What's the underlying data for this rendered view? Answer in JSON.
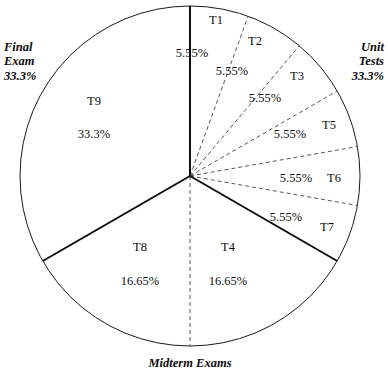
{
  "chart_data": {
    "type": "pie",
    "title": "",
    "subtitle": "",
    "xlabel": "",
    "ylabel": "",
    "legend_position": "outside-radial",
    "grid": false,
    "total_percent": 100,
    "center": {
      "x": 190,
      "y": 176
    },
    "radius": 170,
    "start_angle_deg": 0,
    "direction": "clockwise",
    "categories": [
      "T1",
      "T2",
      "T3",
      "T5",
      "T6",
      "T7",
      "T4",
      "T8",
      "T9"
    ],
    "values": [
      5.55,
      5.55,
      5.55,
      5.55,
      5.55,
      5.55,
      16.65,
      16.65,
      33.3
    ],
    "slices": [
      {
        "name": "T1",
        "percent_label": "5.55%",
        "value": 5.55,
        "group": "Unit Tests",
        "start_deg": 0,
        "end_deg": 20,
        "name_pos": {
          "x": 216,
          "y": 14
        },
        "pct_pos": {
          "x": 192,
          "y": 47
        }
      },
      {
        "name": "T2",
        "percent_label": "5.55%",
        "value": 5.55,
        "group": "Unit Tests",
        "start_deg": 20,
        "end_deg": 40,
        "name_pos": {
          "x": 255,
          "y": 35
        },
        "pct_pos": {
          "x": 232,
          "y": 65
        }
      },
      {
        "name": "T3",
        "percent_label": "5.55%",
        "value": 5.55,
        "group": "Unit Tests",
        "start_deg": 40,
        "end_deg": 60,
        "name_pos": {
          "x": 297,
          "y": 70
        },
        "pct_pos": {
          "x": 265,
          "y": 92
        }
      },
      {
        "name": "T5",
        "percent_label": "5.55%",
        "value": 5.55,
        "group": "Unit Tests",
        "start_deg": 60,
        "end_deg": 80,
        "name_pos": {
          "x": 329,
          "y": 119
        },
        "pct_pos": {
          "x": 290,
          "y": 128
        }
      },
      {
        "name": "T6",
        "percent_label": "5.55%",
        "value": 5.55,
        "group": "Unit Tests",
        "start_deg": 80,
        "end_deg": 100,
        "name_pos": {
          "x": 334,
          "y": 172
        },
        "pct_pos": {
          "x": 296,
          "y": 172
        }
      },
      {
        "name": "T7",
        "percent_label": "5.55%",
        "value": 5.55,
        "group": "Unit Tests",
        "start_deg": 100,
        "end_deg": 120,
        "name_pos": {
          "x": 327,
          "y": 221
        },
        "pct_pos": {
          "x": 286,
          "y": 211
        }
      },
      {
        "name": "T4",
        "percent_label": "16.65%",
        "value": 16.65,
        "group": "Midterm Exams",
        "start_deg": 120,
        "end_deg": 180,
        "name_pos": {
          "x": 228,
          "y": 241
        },
        "pct_pos": {
          "x": 228,
          "y": 275
        }
      },
      {
        "name": "T8",
        "percent_label": "16.65%",
        "value": 16.65,
        "group": "Midterm Exams",
        "start_deg": 180,
        "end_deg": 240,
        "name_pos": {
          "x": 140,
          "y": 241
        },
        "pct_pos": {
          "x": 140,
          "y": 275
        }
      },
      {
        "name": "T9",
        "percent_label": "33.3%",
        "value": 33.3,
        "group": "Final Exam",
        "start_deg": 240,
        "end_deg": 360,
        "name_pos": {
          "x": 94,
          "y": 95
        },
        "pct_pos": {
          "x": 94,
          "y": 128
        }
      }
    ],
    "groups": [
      {
        "key": "final_exam",
        "label_lines": [
          "Final",
          "Exam",
          "33.3%"
        ],
        "percent": 33.3,
        "start_deg": 240,
        "end_deg": 360,
        "members": [
          "T9"
        ],
        "label_pos": {
          "x": 4,
          "y": 40
        },
        "align": "left"
      },
      {
        "key": "unit_tests",
        "label_lines": [
          "Unit",
          "Tests",
          "33.3%"
        ],
        "percent": 33.3,
        "start_deg": 0,
        "end_deg": 120,
        "members": [
          "T1",
          "T2",
          "T3",
          "T5",
          "T6",
          "T7"
        ],
        "label_pos": {
          "x": 384,
          "y": 40
        },
        "align": "right"
      },
      {
        "key": "midterm_exams",
        "label_lines": [
          "Midterm Exams"
        ],
        "percent": 33.3,
        "start_deg": 120,
        "end_deg": 240,
        "members": [
          "T4",
          "T8"
        ],
        "label_pos": {
          "x": 190,
          "y": 356
        },
        "align": "center"
      }
    ],
    "group_divider_angles_deg": [
      0,
      120,
      240
    ],
    "subdivider_angles_deg": [
      20,
      40,
      60,
      80,
      100,
      180
    ],
    "styles": {
      "outline_color": "#1a1a1a",
      "group_divider_color": "#0d0d0d",
      "subdivider_color": "#555555",
      "background": "#ffffff",
      "text_color": "#0d0d0d",
      "subdivider_dash": "4 3"
    }
  }
}
